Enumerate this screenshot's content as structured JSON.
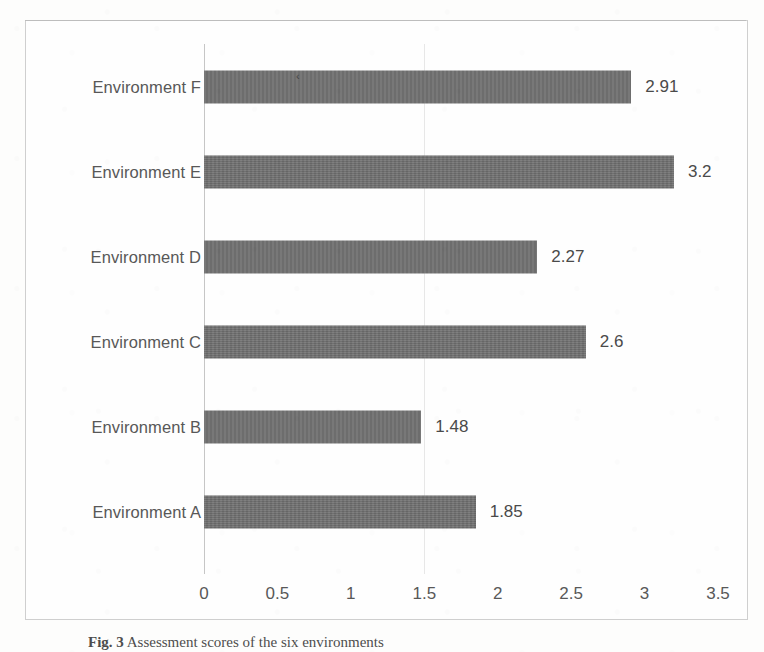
{
  "figure": {
    "caption_label": "Fig. 3",
    "caption_text": "Assessment scores of the six environments"
  },
  "axis": {
    "x_ticks": [
      "0",
      "0.5",
      "1",
      "1.5",
      "2",
      "2.5",
      "3",
      "3.5"
    ]
  },
  "colors": {
    "bar": "#6f6f6f",
    "frame": "#cfcfcf",
    "text": "#585858",
    "axis_line": "#c6c6c6",
    "background": "#fdfdfc"
  },
  "rows": [
    {
      "label": "Environment F",
      "value": "2.91"
    },
    {
      "label": "Environment E",
      "value": "3.2"
    },
    {
      "label": "Environment D",
      "value": "2.27"
    },
    {
      "label": "Environment C",
      "value": "2.6"
    },
    {
      "label": "Environment B",
      "value": "1.48"
    },
    {
      "label": "Environment A",
      "value": "1.85"
    }
  ],
  "chart_data": {
    "type": "bar",
    "orientation": "horizontal",
    "title": "",
    "xlabel": "",
    "ylabel": "",
    "categories": [
      "Environment F",
      "Environment E",
      "Environment D",
      "Environment C",
      "Environment B",
      "Environment A"
    ],
    "values": [
      2.91,
      3.2,
      2.27,
      2.6,
      1.48,
      1.85
    ],
    "data_labels": [
      "2.91",
      "3.2",
      "2.27",
      "2.6",
      "1.48",
      "1.85"
    ],
    "xlim": [
      0,
      3.5
    ],
    "xticks": [
      0,
      0.5,
      1,
      1.5,
      2,
      2.5,
      3,
      3.5
    ],
    "xtick_labels": [
      "0",
      "0.5",
      "1",
      "1.5",
      "2",
      "2.5",
      "3",
      "3.5"
    ],
    "grid": false,
    "legend": false,
    "series_color": "#6f6f6f",
    "category_order_top_to_bottom": [
      "Environment F",
      "Environment E",
      "Environment D",
      "Environment C",
      "Environment B",
      "Environment A"
    ]
  }
}
